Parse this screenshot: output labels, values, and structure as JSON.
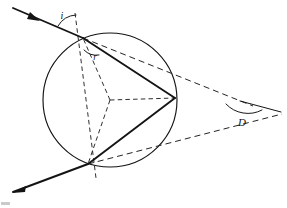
{
  "figure": {
    "caption": "",
    "canvas": {
      "width": 287,
      "height": 208,
      "background": "#ffffff"
    },
    "ink_color": "#141414",
    "dash_color": "#232323"
  },
  "labels": {
    "angle_of_incidence": "i",
    "angle_of_refraction": "r",
    "deviation_angle": "D"
  },
  "label_positions": {
    "i": {
      "x": 62,
      "y": 19
    },
    "r": {
      "x": 95,
      "y": 60
    },
    "D": {
      "x": 242,
      "y": 126
    }
  },
  "geometry": {
    "sphere": {
      "cx": 110,
      "cy": 100,
      "r": 67
    },
    "points": {
      "entry": {
        "x": 83,
        "y": 38
      },
      "internal_reflection": {
        "x": 175,
        "y": 98
      },
      "exit": {
        "x": 88,
        "y": 164
      },
      "center": {
        "x": 110,
        "y": 100
      },
      "deviation_vertex": {
        "x": 240,
        "y": 101
      },
      "incident_start": {
        "x": 13,
        "y": 8
      },
      "emergent_end": {
        "x": 13,
        "y": 192
      },
      "normal_top": {
        "x": 75,
        "y": 13
      },
      "normal_bottom": {
        "x": 96,
        "y": 178
      },
      "incident_extension_end": {
        "x": 253,
        "y": 106
      },
      "emergent_back_extension_end": {
        "x": 282,
        "y": 114
      },
      "deviation_ray_end": {
        "x": 281,
        "y": 112
      }
    },
    "paths": {
      "sphere_circle": "M 43 100 A 67 67 0 1 1 177 100 A 67 67 0 1 1 43 100 Z",
      "incident_ray": "M 13 8 L 83 38",
      "internal_chord_1": "M 83 38 L 175 98",
      "internal_chord_2": "M 175 98 L 88 164",
      "emergent_ray": "M 88 164 L 13 192",
      "normal_line": "M 75 13 L 96 178",
      "radius_to_entry": "M 110 100 L 83 38",
      "radius_to_reflection": "M 110 100 L 175 98",
      "radius_to_exit": "M 110 100 L 88 164",
      "incident_extension": "M 83 38 L 253 106",
      "emergent_back_extension": "M 88 164 L 282 114",
      "deviation_far_ray": "M 240 101 L 281 112"
    },
    "arrows": {
      "incident_arrow_at": {
        "x": 34,
        "y": 18
      },
      "emergent_arrow_at": {
        "x": 15,
        "y": 191
      }
    },
    "angle_arcs": {
      "i_arc": "M 58 26 A 22 22 0 0 1 76 15",
      "r_arc": "M 84 50 A 17 17 0 0 0 99 55",
      "D_arc": "M 226 104 A 30 30 0 0 0 262 110"
    }
  },
  "elements": {
    "sphere_name": "raindrop-sphere",
    "incident_name": "incident-ray",
    "emergent_name": "emergent-ray",
    "normal_name": "surface-normal-dashed",
    "deviation_name": "deviation-angle-marker"
  }
}
